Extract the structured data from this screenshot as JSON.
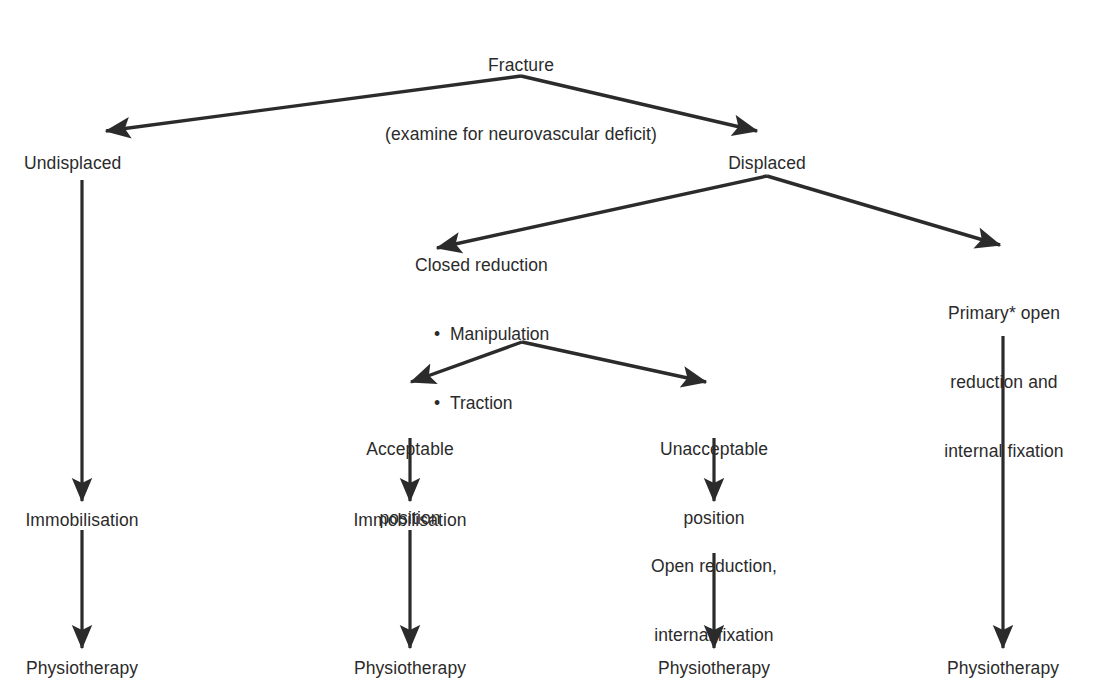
{
  "diagram": {
    "type": "flowchart",
    "line_color": "#2b2b2b",
    "text_color": "#2b2b2b",
    "background_color": "#ffffff",
    "nodes": {
      "root_line1": "Fracture",
      "root_line2": "(examine for neurovascular deficit)",
      "undisplaced": "Undisplaced",
      "displaced": "Displaced",
      "closed_reduction_heading": "Closed reduction",
      "closed_reduction_bullet1": "Manipulation",
      "closed_reduction_bullet2": "Traction",
      "bullet_glyph": "•",
      "primary_orif_line1": "Primary* open",
      "primary_orif_line2": "reduction and",
      "primary_orif_line3": "internal fixation",
      "acceptable_line1": "Acceptable",
      "acceptable_line2": "position",
      "unacceptable_line1": "Unacceptable",
      "unacceptable_line2": "position",
      "immobilisation_left": "Immobilisation",
      "immobilisation_middle": "Immobilisation",
      "orif_line1": "Open reduction,",
      "orif_line2": "internal fixation",
      "physiotherapy_col1": "Physiotherapy",
      "physiotherapy_col2": "Physiotherapy",
      "physiotherapy_col3": "Physiotherapy",
      "physiotherapy_col4": "Physiotherapy"
    }
  }
}
